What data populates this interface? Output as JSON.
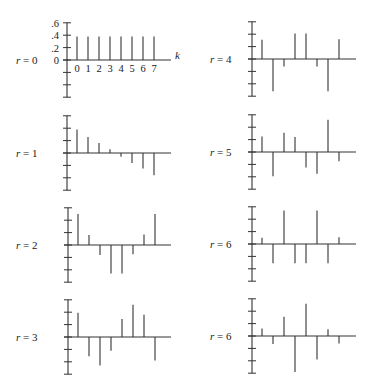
{
  "chart_data": [
    {
      "type": "bar",
      "subtype": "stem",
      "label": "r = 0",
      "r": "0",
      "x_axis_label": "k",
      "x_tick_labels": [
        "0",
        "1",
        "2",
        "3",
        "4",
        "5",
        "6",
        "7"
      ],
      "y_tick_labels": [
        ".6",
        ".4",
        ".2",
        "0"
      ],
      "ylim": [
        -0.6,
        0.6
      ],
      "categories": [
        0,
        1,
        2,
        3,
        4,
        5,
        6,
        7
      ],
      "values": [
        0.38,
        0.38,
        0.38,
        0.38,
        0.38,
        0.38,
        0.38,
        0.38
      ]
    },
    {
      "type": "bar",
      "subtype": "stem",
      "label": "r = 1",
      "r": "1",
      "ylim": [
        -0.6,
        0.6
      ],
      "categories": [
        0,
        1,
        2,
        3,
        4,
        5,
        6,
        7
      ],
      "values": [
        0.38,
        0.26,
        0.16,
        0.06,
        -0.06,
        -0.16,
        -0.25,
        -0.36
      ]
    },
    {
      "type": "bar",
      "subtype": "stem",
      "label": "r = 2",
      "r": "2",
      "ylim": [
        -0.6,
        0.6
      ],
      "categories": [
        0,
        1,
        2,
        3,
        4,
        5,
        6,
        7
      ],
      "values": [
        0.5,
        0.16,
        -0.16,
        -0.46,
        -0.46,
        -0.15,
        0.17,
        0.5
      ]
    },
    {
      "type": "bar",
      "subtype": "stem",
      "label": "r = 3",
      "r": "3",
      "ylim": [
        -0.6,
        0.6
      ],
      "categories": [
        0,
        1,
        2,
        3,
        4,
        5,
        6,
        7
      ],
      "values": [
        0.39,
        -0.31,
        -0.46,
        -0.22,
        0.29,
        0.52,
        0.36,
        -0.38
      ]
    },
    {
      "type": "bar",
      "subtype": "stem",
      "label": "r = 4",
      "r": "4",
      "ylim": [
        -0.6,
        0.6
      ],
      "categories": [
        0,
        1,
        2,
        3,
        4,
        5,
        6,
        7
      ],
      "values": [
        0.31,
        -0.52,
        -0.12,
        0.41,
        0.41,
        -0.12,
        -0.52,
        0.32
      ]
    },
    {
      "type": "bar",
      "subtype": "stem",
      "label": "r = 5",
      "r": "5",
      "ylim": [
        -0.6,
        0.6
      ],
      "categories": [
        0,
        1,
        2,
        3,
        4,
        5,
        6,
        7
      ],
      "values": [
        0.25,
        -0.39,
        0.31,
        0.24,
        -0.25,
        -0.35,
        0.52,
        -0.15
      ]
    },
    {
      "type": "bar",
      "subtype": "stem",
      "label": "r = 6",
      "r": "6",
      "ylim": [
        -0.6,
        0.6
      ],
      "categories": [
        0,
        1,
        2,
        3,
        4,
        5,
        6,
        7
      ],
      "values": [
        0.1,
        -0.31,
        0.54,
        -0.31,
        -0.31,
        0.54,
        -0.31,
        0.11
      ]
    },
    {
      "type": "bar",
      "subtype": "stem",
      "label": "r = 6",
      "r": "6",
      "ylim": [
        -0.6,
        0.6
      ],
      "categories": [
        0,
        1,
        2,
        3,
        4,
        5,
        6,
        7
      ],
      "values": [
        0.12,
        -0.13,
        0.31,
        -0.58,
        0.52,
        -0.38,
        0.11,
        -0.12
      ]
    }
  ],
  "layout": {
    "panels": [
      {
        "axis_x": 67,
        "base_y": 60,
        "label_x": 16,
        "axis_end_x": 171
      },
      {
        "axis_x": 67,
        "base_y": 153,
        "label_x": 16,
        "axis_end_x": 171
      },
      {
        "axis_x": 68,
        "base_y": 245,
        "label_x": 16,
        "axis_end_x": 171
      },
      {
        "axis_x": 68,
        "base_y": 337,
        "label_x": 16,
        "axis_end_x": 171
      },
      {
        "axis_x": 252,
        "base_y": 59,
        "label_x": 210,
        "axis_end_x": 356
      },
      {
        "axis_x": 252,
        "base_y": 152,
        "label_x": 210,
        "axis_end_x": 356
      },
      {
        "axis_x": 252,
        "base_y": 244,
        "label_x": 210,
        "axis_end_x": 356
      },
      {
        "axis_x": 252,
        "base_y": 336,
        "label_x": 210,
        "axis_end_x": 356
      }
    ],
    "px_per_unit": 62,
    "stem_offset": 10,
    "stem_spacing": 11,
    "line_color": "#333333"
  }
}
